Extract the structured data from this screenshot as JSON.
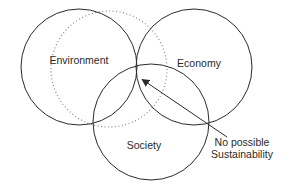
{
  "diagram": {
    "type": "venn",
    "circles": [
      {
        "id": "environment",
        "label": "Environment",
        "cx": 79,
        "cy": 67,
        "r": 58,
        "style": "solid",
        "label_x": 79,
        "label_y": 64
      },
      {
        "id": "economy",
        "label": "Economy",
        "cx": 194,
        "cy": 67,
        "r": 58,
        "style": "solid",
        "label_x": 199,
        "label_y": 67
      },
      {
        "id": "society",
        "label": "Society",
        "cx": 151,
        "cy": 122,
        "r": 58,
        "style": "solid",
        "label_x": 144,
        "label_y": 149
      },
      {
        "id": "dotted",
        "label": "",
        "cx": 109,
        "cy": 69,
        "r": 58,
        "style": "dotted"
      }
    ],
    "annotation": {
      "lines": [
        "No possible",
        "Sustainability"
      ],
      "text_x": 242,
      "text_y": [
        146,
        158
      ],
      "arrow_from": [
        227,
        137
      ],
      "arrow_to": [
        141,
        78
      ]
    },
    "colors": {
      "stroke": "#2a2a2a",
      "dotted": "#8a8a8a",
      "text": "#2a2a2a",
      "background": "#ffffff"
    }
  }
}
